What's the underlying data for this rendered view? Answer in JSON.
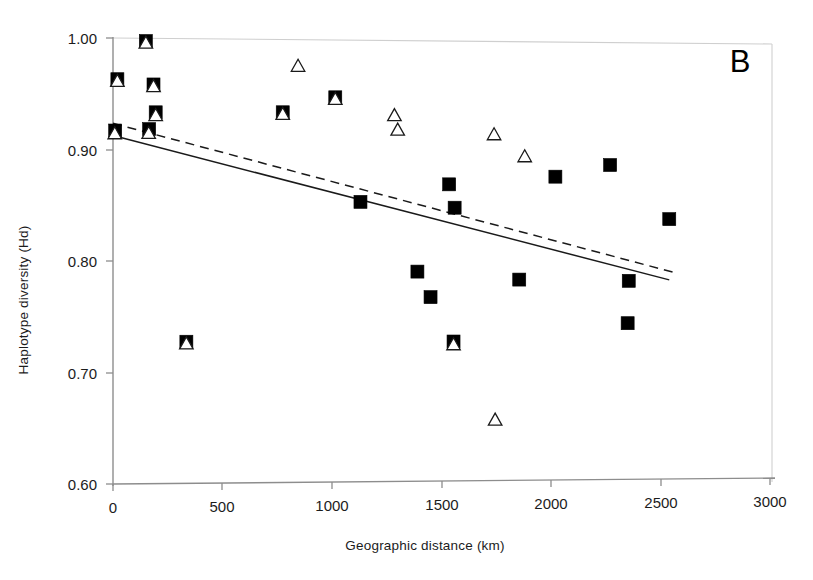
{
  "panel": {
    "label": "B"
  },
  "chart_data": {
    "type": "scatter",
    "title": "",
    "subtitle": "",
    "xlabel": "Geographic distance (km)",
    "ylabel": "Haplotype diversity (Hd)",
    "xlim": [
      0,
      3000
    ],
    "ylim": [
      0.6,
      1.0
    ],
    "xticks": [
      0,
      500,
      1000,
      1500,
      2000,
      2500,
      3000
    ],
    "xtick_labels": [
      "0",
      "500",
      "1000",
      "1500",
      "2000",
      "2500",
      "3000"
    ],
    "yticks": [
      0.6,
      0.7,
      0.8,
      0.9,
      1.0
    ],
    "ytick_labels": [
      "0.60",
      "0.70",
      "0.80",
      "0.90",
      "1.00"
    ],
    "grid": false,
    "legend": "none",
    "legend_position": "none",
    "series": [
      {
        "name": "Filled squares",
        "marker": "filled-square",
        "points": [
          [
            20,
            0.963
          ],
          [
            150,
            0.997
          ],
          [
            165,
            0.918
          ],
          [
            185,
            0.958
          ],
          [
            195,
            0.933
          ],
          [
            10,
            0.917
          ],
          [
            335,
            0.727
          ],
          [
            775,
            0.932
          ],
          [
            1015,
            0.945
          ],
          [
            1130,
            0.851
          ],
          [
            1390,
            0.788
          ],
          [
            1450,
            0.765
          ],
          [
            1535,
            0.866
          ],
          [
            1560,
            0.845
          ],
          [
            1555,
            0.725
          ],
          [
            1855,
            0.78
          ],
          [
            2020,
            0.872
          ],
          [
            2270,
            0.882
          ],
          [
            2355,
            0.778
          ],
          [
            2350,
            0.74
          ],
          [
            2540,
            0.833
          ]
        ]
      },
      {
        "name": "Open triangles",
        "marker": "open-triangle",
        "points": [
          [
            20,
            0.962
          ],
          [
            150,
            0.996
          ],
          [
            163,
            0.915
          ],
          [
            185,
            0.957
          ],
          [
            195,
            0.931
          ],
          [
            8,
            0.915
          ],
          [
            335,
            0.726
          ],
          [
            775,
            0.931
          ],
          [
            845,
            0.974
          ],
          [
            1015,
            0.944
          ],
          [
            1285,
            0.929
          ],
          [
            1300,
            0.916
          ],
          [
            1555,
            0.723
          ],
          [
            1740,
            0.911
          ],
          [
            1745,
            0.655
          ],
          [
            1880,
            0.891
          ]
        ]
      }
    ],
    "trend_lines": [
      {
        "name": "solid-regression-line",
        "style": "solid",
        "x_start": 0,
        "y_start": 0.9125,
        "x_end": 2540,
        "y_end": 0.7785
      },
      {
        "name": "dashed-regression-line",
        "style": "dashed",
        "x_start": 0,
        "y_start": 0.9235,
        "x_end": 2555,
        "y_end": 0.7855
      }
    ]
  }
}
